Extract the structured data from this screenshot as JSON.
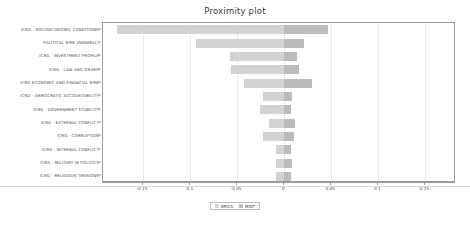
{
  "chart_data": {
    "type": "bar",
    "orientation": "horizontal",
    "title": "Proximity plot",
    "xlabel": "",
    "ylabel": "",
    "xlim": [
      -0.1925,
      0.1825
    ],
    "grid": true,
    "legend_position": "bottom-center",
    "xticks": [
      -0.15,
      -0.1,
      -0.05,
      0,
      0.05,
      0.1,
      0.15
    ],
    "xticklabels": [
      "-0.15",
      "-0.1",
      "-0.05",
      "0",
      "0.05",
      "0.1",
      "0.15"
    ],
    "categories": [
      "ICRG - SOCIOECONOMIC CONDITIONS",
      "POLITICAL RISK (GENERAL)",
      "ICRG - INVESTMENT PROFILE",
      "ICRG - LAW AND ORDER",
      "ICRG ECONOMIC AND FINANCIAL RISK",
      "ICRG - DEMOCRATIC ACCOUNTABILITY",
      "ICRG - GOVERNMENT STABILITY",
      "ICRG - EXTERNAL CONFLICT",
      "ICRG - CORRUPTION",
      "ICRG - INTERNAL CONFLICT",
      "ICRG - MILITARY IN POLITICS",
      "ICRG - RELIGIOUS TENSIONS"
    ],
    "series": [
      {
        "name": "BRICS",
        "color": "#d2d2d2",
        "values": [
          -0.178,
          -0.094,
          -0.058,
          -0.057,
          -0.043,
          -0.023,
          -0.026,
          -0.016,
          -0.022,
          -0.009,
          -0.009,
          -0.009
        ]
      },
      {
        "name": "MINT",
        "color": "#bcbcbc",
        "values": [
          0.047,
          0.021,
          0.014,
          0.016,
          0.029,
          0.008,
          0.007,
          0.011,
          0.01,
          0.007,
          0.008,
          0.007
        ]
      }
    ]
  },
  "legend": {
    "entries": [
      {
        "label": "BRICS",
        "swatch": "brics"
      },
      {
        "label": "MINT",
        "swatch": "mint"
      }
    ]
  }
}
